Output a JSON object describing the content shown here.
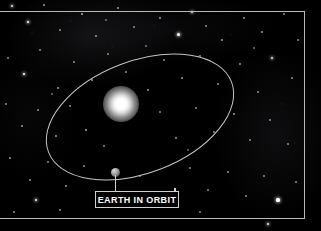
{
  "scene": {
    "title": "Earth In Orbit",
    "width": 321,
    "height": 231,
    "background_color": "#000000"
  },
  "frame": {
    "border_color": "#b9b9b9"
  },
  "callout": {
    "label": "EARTH IN ORBIT",
    "text_color": "#ffffff",
    "border_color": "#d0d0d0"
  },
  "objects": {
    "sun": {
      "name": "Sun",
      "color": "#ffffff",
      "cx": 121,
      "cy": 104
    },
    "earth": {
      "name": "Earth",
      "color": "#9a9a9a",
      "cx": 115,
      "cy": 172
    },
    "orbit": {
      "name": "Orbit path",
      "stroke_color": "#c4c4c4",
      "cx": 140,
      "cy": 117,
      "rx": 98,
      "ry": 56,
      "rotation_deg": -21
    }
  },
  "starfield": {
    "star_color": "#ffffff",
    "nebula_color": "#3a3a42",
    "stars": [
      {
        "x": 12,
        "y": 6,
        "r": 1.2,
        "b": 0.85
      },
      {
        "x": 28,
        "y": 22,
        "r": 1.4,
        "b": 1.0
      },
      {
        "x": 44,
        "y": 5,
        "r": 0.9,
        "b": 0.6
      },
      {
        "x": 60,
        "y": 30,
        "r": 0.8,
        "b": 0.5
      },
      {
        "x": 82,
        "y": 14,
        "r": 1.0,
        "b": 0.7
      },
      {
        "x": 96,
        "y": 36,
        "r": 0.8,
        "b": 0.55
      },
      {
        "x": 118,
        "y": 8,
        "r": 0.9,
        "b": 0.6
      },
      {
        "x": 134,
        "y": 27,
        "r": 0.8,
        "b": 0.5
      },
      {
        "x": 160,
        "y": 18,
        "r": 0.9,
        "b": 0.6
      },
      {
        "x": 178,
        "y": 34,
        "r": 1.5,
        "b": 1.0
      },
      {
        "x": 192,
        "y": 12,
        "r": 1.3,
        "b": 0.9
      },
      {
        "x": 206,
        "y": 26,
        "r": 0.8,
        "b": 0.5
      },
      {
        "x": 222,
        "y": 40,
        "r": 0.9,
        "b": 0.6
      },
      {
        "x": 244,
        "y": 18,
        "r": 0.8,
        "b": 0.5
      },
      {
        "x": 262,
        "y": 32,
        "r": 0.9,
        "b": 0.6
      },
      {
        "x": 284,
        "y": 14,
        "r": 0.8,
        "b": 0.5
      },
      {
        "x": 298,
        "y": 40,
        "r": 0.8,
        "b": 0.5
      },
      {
        "x": 8,
        "y": 58,
        "r": 0.8,
        "b": 0.5
      },
      {
        "x": 24,
        "y": 74,
        "r": 1.4,
        "b": 1.0
      },
      {
        "x": 40,
        "y": 50,
        "r": 0.8,
        "b": 0.5
      },
      {
        "x": 58,
        "y": 88,
        "r": 0.9,
        "b": 0.6
      },
      {
        "x": 74,
        "y": 62,
        "r": 0.8,
        "b": 0.5
      },
      {
        "x": 92,
        "y": 80,
        "r": 0.9,
        "b": 0.6
      },
      {
        "x": 108,
        "y": 54,
        "r": 0.8,
        "b": 0.5
      },
      {
        "x": 126,
        "y": 72,
        "r": 0.8,
        "b": 0.5
      },
      {
        "x": 148,
        "y": 90,
        "r": 0.9,
        "b": 0.6
      },
      {
        "x": 164,
        "y": 60,
        "r": 0.8,
        "b": 0.5
      },
      {
        "x": 182,
        "y": 78,
        "r": 0.9,
        "b": 0.6
      },
      {
        "x": 200,
        "y": 56,
        "r": 0.8,
        "b": 0.5
      },
      {
        "x": 218,
        "y": 84,
        "r": 0.8,
        "b": 0.5
      },
      {
        "x": 240,
        "y": 64,
        "r": 0.9,
        "b": 0.6
      },
      {
        "x": 258,
        "y": 92,
        "r": 0.8,
        "b": 0.5
      },
      {
        "x": 272,
        "y": 58,
        "r": 1.3,
        "b": 0.9
      },
      {
        "x": 292,
        "y": 78,
        "r": 0.8,
        "b": 0.5
      },
      {
        "x": 6,
        "y": 104,
        "r": 0.8,
        "b": 0.5
      },
      {
        "x": 22,
        "y": 126,
        "r": 0.9,
        "b": 0.6
      },
      {
        "x": 38,
        "y": 110,
        "r": 0.8,
        "b": 0.5
      },
      {
        "x": 56,
        "y": 136,
        "r": 0.9,
        "b": 0.6
      },
      {
        "x": 70,
        "y": 106,
        "r": 0.8,
        "b": 0.5
      },
      {
        "x": 86,
        "y": 130,
        "r": 1.0,
        "b": 0.7
      },
      {
        "x": 104,
        "y": 146,
        "r": 0.8,
        "b": 0.5
      },
      {
        "x": 160,
        "y": 112,
        "r": 0.8,
        "b": 0.5
      },
      {
        "x": 176,
        "y": 138,
        "r": 0.9,
        "b": 0.6
      },
      {
        "x": 196,
        "y": 108,
        "r": 0.8,
        "b": 0.5
      },
      {
        "x": 214,
        "y": 132,
        "r": 0.8,
        "b": 0.5
      },
      {
        "x": 234,
        "y": 114,
        "r": 0.9,
        "b": 0.6
      },
      {
        "x": 250,
        "y": 140,
        "r": 0.8,
        "b": 0.5
      },
      {
        "x": 270,
        "y": 120,
        "r": 0.8,
        "b": 0.5
      },
      {
        "x": 288,
        "y": 144,
        "r": 0.8,
        "b": 0.5
      },
      {
        "x": 10,
        "y": 158,
        "r": 0.9,
        "b": 0.6
      },
      {
        "x": 30,
        "y": 180,
        "r": 0.8,
        "b": 0.5
      },
      {
        "x": 48,
        "y": 162,
        "r": 0.8,
        "b": 0.5
      },
      {
        "x": 66,
        "y": 186,
        "r": 0.9,
        "b": 0.6
      },
      {
        "x": 84,
        "y": 166,
        "r": 0.8,
        "b": 0.5
      },
      {
        "x": 140,
        "y": 176,
        "r": 0.8,
        "b": 0.5
      },
      {
        "x": 190,
        "y": 168,
        "r": 0.8,
        "b": 0.5
      },
      {
        "x": 208,
        "y": 190,
        "r": 0.8,
        "b": 0.5
      },
      {
        "x": 228,
        "y": 172,
        "r": 0.9,
        "b": 0.6
      },
      {
        "x": 246,
        "y": 196,
        "r": 0.8,
        "b": 0.5
      },
      {
        "x": 264,
        "y": 176,
        "r": 0.8,
        "b": 0.5
      },
      {
        "x": 278,
        "y": 200,
        "r": 1.6,
        "b": 1.0
      },
      {
        "x": 296,
        "y": 182,
        "r": 0.8,
        "b": 0.5
      },
      {
        "x": 36,
        "y": 200,
        "r": 1.4,
        "b": 0.95
      },
      {
        "x": 14,
        "y": 212,
        "r": 0.8,
        "b": 0.5
      },
      {
        "x": 60,
        "y": 210,
        "r": 0.8,
        "b": 0.5
      },
      {
        "x": 200,
        "y": 212,
        "r": 0.8,
        "b": 0.5
      },
      {
        "x": 268,
        "y": 224,
        "r": 1.3,
        "b": 0.9
      },
      {
        "x": 120,
        "y": 196,
        "r": 0.7,
        "b": 0.4
      },
      {
        "x": 52,
        "y": 94,
        "r": 0.7,
        "b": 0.4
      },
      {
        "x": 146,
        "y": 46,
        "r": 0.7,
        "b": 0.4
      },
      {
        "x": 254,
        "y": 48,
        "r": 0.7,
        "b": 0.4
      },
      {
        "x": 188,
        "y": 150,
        "r": 0.7,
        "b": 0.4
      },
      {
        "x": 106,
        "y": 20,
        "r": 0.7,
        "b": 0.4
      }
    ]
  }
}
